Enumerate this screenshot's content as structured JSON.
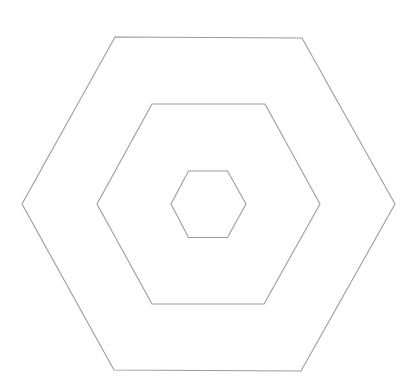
{
  "diagram": {
    "width": 417,
    "height": 388,
    "background": "#ffffff",
    "stroke_color": "#9c9c9c",
    "shapes": [
      {
        "name": "outer-hexagon",
        "type": "hexagon",
        "points": "115,37 302,38 395,204 301,371 114,370 22,204"
      },
      {
        "name": "middle-hexagon",
        "type": "hexagon",
        "points": "152,104 265,104 320,204 264,304 152,304 97,204"
      },
      {
        "name": "inner-hexagon",
        "type": "hexagon",
        "points": "188.5,171 227.5,171 246,204 227.5,237.5 188.5,237.5 171,204"
      }
    ]
  }
}
